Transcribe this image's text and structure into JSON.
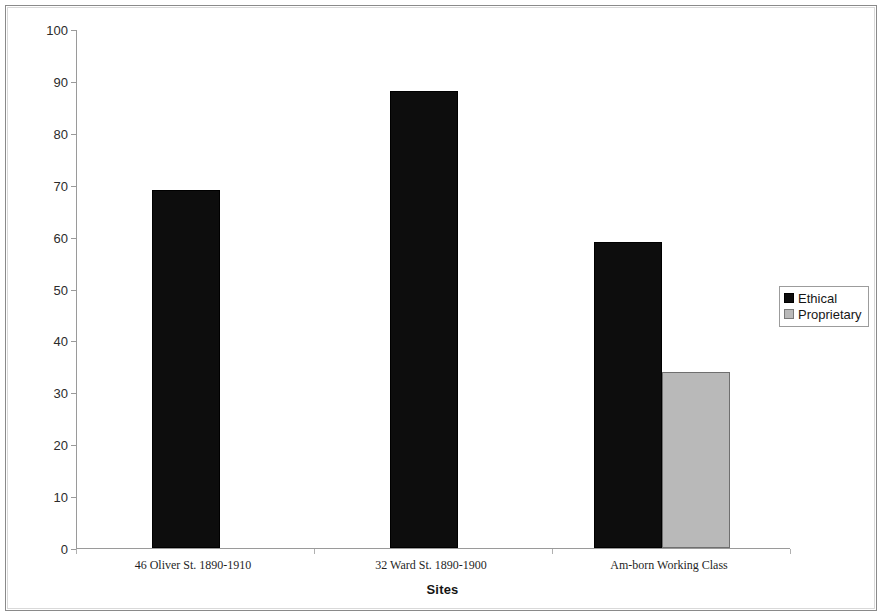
{
  "chart_data": {
    "type": "bar",
    "title": "",
    "xlabel": "Sites",
    "ylabel": "Percent",
    "categories": [
      "46 Oliver St. 1890-1910",
      "32 Ward St. 1890-1900",
      "Am-born Working Class"
    ],
    "series": [
      {
        "name": "Ethical",
        "color": "#0d0d0d",
        "values": [
          69,
          88,
          59
        ]
      },
      {
        "name": "Proprietary",
        "color": "#b9b9b9",
        "values": [
          null,
          null,
          34
        ]
      }
    ],
    "ylim": [
      0,
      100
    ],
    "y_ticks": [
      0,
      10,
      20,
      30,
      40,
      50,
      60,
      70,
      80,
      90,
      100
    ],
    "y_tick_labels": [
      "0",
      "10",
      "20",
      "30",
      "40",
      "50",
      "60",
      "70",
      "80",
      "90",
      "100"
    ],
    "grid": false,
    "legend_position": "right"
  },
  "legend": {
    "entries": [
      {
        "label": "Ethical",
        "swatch": "black-square-swatch"
      },
      {
        "label": "Proprietary",
        "swatch": "gray-square-swatch"
      }
    ]
  }
}
